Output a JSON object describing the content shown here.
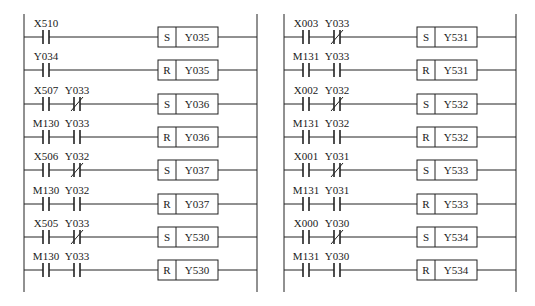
{
  "diagram": {
    "type": "ladder-logic",
    "ladders": [
      {
        "name": "left",
        "rail_left_x": 24,
        "rail_right_x": 257,
        "coil_x": 158,
        "rungs": [
          {
            "contacts": [
              {
                "label": "X510",
                "type": "NO"
              }
            ],
            "coil": {
              "op": "S",
              "target": "Y035"
            }
          },
          {
            "contacts": [
              {
                "label": "Y034",
                "type": "NO"
              }
            ],
            "coil": {
              "op": "R",
              "target": "Y035"
            }
          },
          {
            "contacts": [
              {
                "label": "X507",
                "type": "NO"
              },
              {
                "label": "Y033",
                "type": "NC"
              }
            ],
            "coil": {
              "op": "S",
              "target": "Y036"
            }
          },
          {
            "contacts": [
              {
                "label": "M130",
                "type": "NO"
              },
              {
                "label": "Y033",
                "type": "NO"
              }
            ],
            "coil": {
              "op": "R",
              "target": "Y036"
            }
          },
          {
            "contacts": [
              {
                "label": "X506",
                "type": "NO"
              },
              {
                "label": "Y032",
                "type": "NC"
              }
            ],
            "coil": {
              "op": "S",
              "target": "Y037"
            }
          },
          {
            "contacts": [
              {
                "label": "M130",
                "type": "NO"
              },
              {
                "label": "Y032",
                "type": "NO"
              }
            ],
            "coil": {
              "op": "R",
              "target": "Y037"
            }
          },
          {
            "contacts": [
              {
                "label": "X505",
                "type": "NO"
              },
              {
                "label": "Y033",
                "type": "NC"
              }
            ],
            "coil": {
              "op": "S",
              "target": "Y530"
            }
          },
          {
            "contacts": [
              {
                "label": "M130",
                "type": "NO"
              },
              {
                "label": "Y033",
                "type": "NO"
              }
            ],
            "coil": {
              "op": "R",
              "target": "Y530"
            }
          }
        ]
      },
      {
        "name": "right",
        "rail_left_x": 284,
        "rail_right_x": 516,
        "coil_x": 417,
        "rungs": [
          {
            "contacts": [
              {
                "label": "X003",
                "type": "NO"
              },
              {
                "label": "Y033",
                "type": "NC"
              }
            ],
            "coil": {
              "op": "S",
              "target": "Y531"
            }
          },
          {
            "contacts": [
              {
                "label": "M131",
                "type": "NO"
              },
              {
                "label": "Y033",
                "type": "NO"
              }
            ],
            "coil": {
              "op": "R",
              "target": "Y531"
            }
          },
          {
            "contacts": [
              {
                "label": "X002",
                "type": "NO"
              },
              {
                "label": "Y032",
                "type": "NC"
              }
            ],
            "coil": {
              "op": "S",
              "target": "Y532"
            }
          },
          {
            "contacts": [
              {
                "label": "M131",
                "type": "NO"
              },
              {
                "label": "Y032",
                "type": "NO"
              }
            ],
            "coil": {
              "op": "R",
              "target": "Y532"
            }
          },
          {
            "contacts": [
              {
                "label": "X001",
                "type": "NO"
              },
              {
                "label": "Y031",
                "type": "NC"
              }
            ],
            "coil": {
              "op": "S",
              "target": "Y533"
            }
          },
          {
            "contacts": [
              {
                "label": "M131",
                "type": "NO"
              },
              {
                "label": "Y031",
                "type": "NO"
              }
            ],
            "coil": {
              "op": "R",
              "target": "Y533"
            }
          },
          {
            "contacts": [
              {
                "label": "X000",
                "type": "NO"
              },
              {
                "label": "Y030",
                "type": "NC"
              }
            ],
            "coil": {
              "op": "S",
              "target": "Y534"
            }
          },
          {
            "contacts": [
              {
                "label": "M131",
                "type": "NO"
              },
              {
                "label": "Y030",
                "type": "NO"
              }
            ],
            "coil": {
              "op": "R",
              "target": "Y534"
            }
          }
        ]
      }
    ]
  }
}
